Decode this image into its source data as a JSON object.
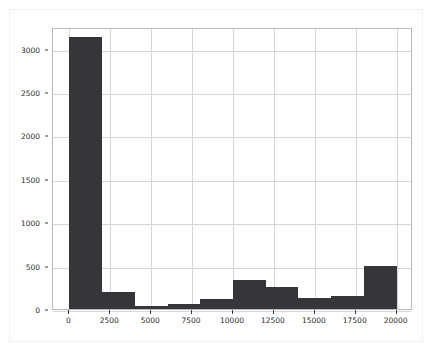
{
  "figure": {
    "background_color": "#ffffff",
    "border_color": "#f0f0f0",
    "axes_edge_color": "#b9b9bd",
    "grid_color": "#d6d6da",
    "bar_color": "#36363a"
  },
  "chart_data": {
    "type": "bar",
    "subtype": "histogram",
    "title": "",
    "xlabel": "",
    "ylabel": "",
    "xlim": [
      -1000,
      21000
    ],
    "ylim": [
      0,
      3250
    ],
    "grid": true,
    "legend": null,
    "bin_width": 2000,
    "bin_edges": [
      0,
      2000,
      4000,
      6000,
      8000,
      10000,
      12000,
      14000,
      16000,
      18000,
      20000
    ],
    "categories": [
      "0-2000",
      "2000-4000",
      "4000-6000",
      "6000-8000",
      "8000-10000",
      "10000-12000",
      "12000-14000",
      "14000-16000",
      "16000-18000",
      "18000-20000"
    ],
    "values": [
      3130,
      200,
      35,
      60,
      110,
      340,
      250,
      130,
      150,
      490
    ],
    "xticks": [
      0,
      2500,
      5000,
      7500,
      10000,
      12500,
      15000,
      17500,
      20000
    ],
    "xtick_labels": [
      "0",
      "2500",
      "5000",
      "7500",
      "10000",
      "12500",
      "15000",
      "17500",
      "20000"
    ],
    "yticks": [
      0,
      500,
      1000,
      1500,
      2000,
      2500,
      3000
    ],
    "ytick_labels": [
      "0",
      "500",
      "1000",
      "1500",
      "2000",
      "2500",
      "3000"
    ]
  }
}
